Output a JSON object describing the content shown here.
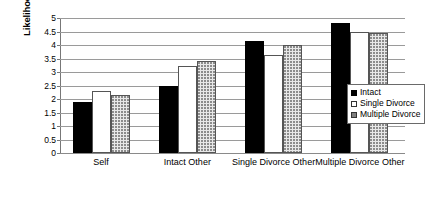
{
  "chart_data": {
    "type": "bar",
    "title": "",
    "xlabel": "",
    "ylabel": "Likelihood of Getting a Divorce",
    "ylim": [
      0,
      5
    ],
    "yticks": [
      "0",
      "0.5",
      "1",
      "1.5",
      "2",
      "2.5",
      "3",
      "3.5",
      "4",
      "4.5",
      "5"
    ],
    "grid": true,
    "legend_position": "right",
    "categories": [
      "Self",
      "Intact Other",
      "Single Divorce Other",
      "Multiple Divorce Other"
    ],
    "series": [
      {
        "name": "Intact",
        "color": "#000000",
        "fill": "solid-black",
        "values": [
          1.88,
          2.5,
          4.15,
          4.8
        ]
      },
      {
        "name": "Single Divorce",
        "color": "#ffffff",
        "fill": "white",
        "values": [
          2.3,
          3.22,
          3.63,
          4.5
        ]
      },
      {
        "name": "Multiple Divorce",
        "color": "#e8e8e8",
        "fill": "dotted",
        "values": [
          2.16,
          3.41,
          4.01,
          4.46
        ]
      }
    ]
  }
}
